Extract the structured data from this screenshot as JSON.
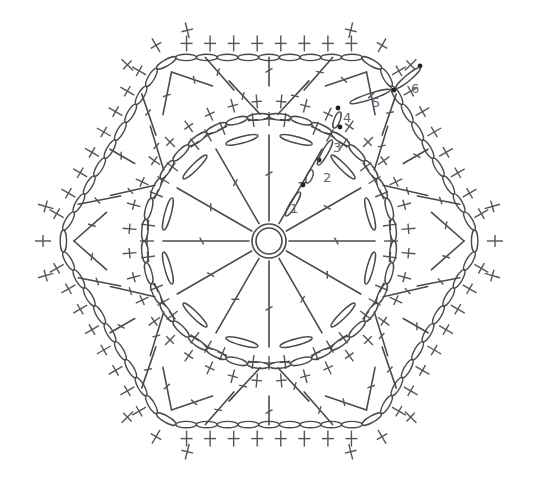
{
  "diagram": {
    "type": "crochet-chart",
    "shape": "hexagon",
    "center": [
      269,
      241
    ],
    "colors": {
      "stroke": "#4a4a4a",
      "label": "#666666",
      "background": "#ffffff"
    },
    "center_ring": {
      "outer_r": 17,
      "inner_r": 13
    },
    "rounds": [
      {
        "n": 1,
        "label": "1",
        "spokes": 12,
        "stitch": "dc",
        "radius": 60,
        "label_pos": [
          290,
          213
        ]
      },
      {
        "n": 2,
        "label": "2",
        "stitch": "sc",
        "radius": 68,
        "label_pos": [
          323,
          182
        ]
      },
      {
        "n": 3,
        "label": "3",
        "stitch": "chain-arch",
        "radius": 115,
        "label_pos": [
          333,
          152
        ]
      },
      {
        "n": 4,
        "label": "4",
        "stitch": "sc",
        "radius": 125,
        "label_pos": [
          343,
          122
        ]
      },
      {
        "n": 5,
        "label": "5",
        "stitch": "chain-arch-hex",
        "radius": 205,
        "label_pos": [
          372,
          107
        ]
      },
      {
        "n": 6,
        "label": "6",
        "stitch": "sc",
        "radius": 218,
        "label_pos": [
          411,
          93
        ]
      }
    ],
    "labels": [
      "1",
      "2",
      "3",
      "4",
      "5",
      "6"
    ]
  }
}
